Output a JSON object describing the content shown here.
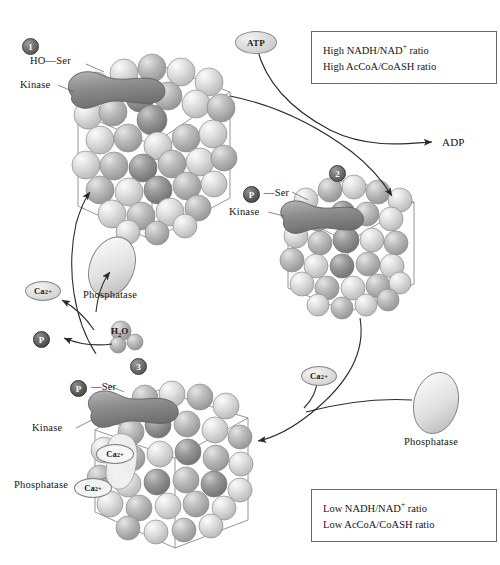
{
  "figure": {
    "type": "biochemical-cycle-diagram"
  },
  "steps": [
    {
      "id": "step-1",
      "number": "1"
    },
    {
      "id": "step-2",
      "number": "2"
    },
    {
      "id": "step-3",
      "number": "3"
    }
  ],
  "complex1": {
    "ser_label": "HO—Ser",
    "kinase_label": "Kinase"
  },
  "complex2": {
    "phospho_badge": "P",
    "ser_label": "Ser",
    "kinase_label": "Kinase"
  },
  "complex3": {
    "phospho_badge": "P",
    "ser_label": "Ser",
    "kinase_label": "Kinase",
    "phosphatase_label": "Phosphatase",
    "bound_calcium": [
      {
        "label": "Ca",
        "charge": "2+"
      },
      {
        "label": "Ca",
        "charge": "2+"
      }
    ]
  },
  "molecules": {
    "atp": "ATP",
    "adp": "ADP",
    "phosphate_badge": "P",
    "water": {
      "formula": "H",
      "subscript": "2",
      "suffix": "O"
    },
    "calcium_left": {
      "label": "Ca",
      "charge": "2+"
    },
    "calcium_right": {
      "label": "Ca",
      "charge": "2+"
    },
    "phosphatase_mid": "Phosphatase",
    "phosphatase_right": "Phosphatase"
  },
  "ratio_box_top": {
    "lines": [
      {
        "prefix": "High NADH/NAD",
        "sup": "+",
        "suffix": " ratio"
      },
      {
        "prefix": "High AcCoA/CoASH ratio",
        "sup": "",
        "suffix": ""
      }
    ]
  },
  "ratio_box_bottom": {
    "lines": [
      {
        "prefix": "Low NADH/NAD",
        "sup": "+",
        "suffix": " ratio"
      },
      {
        "prefix": "Low AcCoA/CoASH ratio",
        "sup": "",
        "suffix": ""
      }
    ]
  },
  "colors": {
    "sphere_light": "#e3e3e3",
    "sphere_mid": "#b4b4b4",
    "sphere_dark": "#8a8a8a",
    "kinase_fill": "#8f8f8f",
    "phosphatase_fill": "#dcdcdc",
    "line": "#3a3a3a",
    "box_border": "#6a6a6a"
  }
}
